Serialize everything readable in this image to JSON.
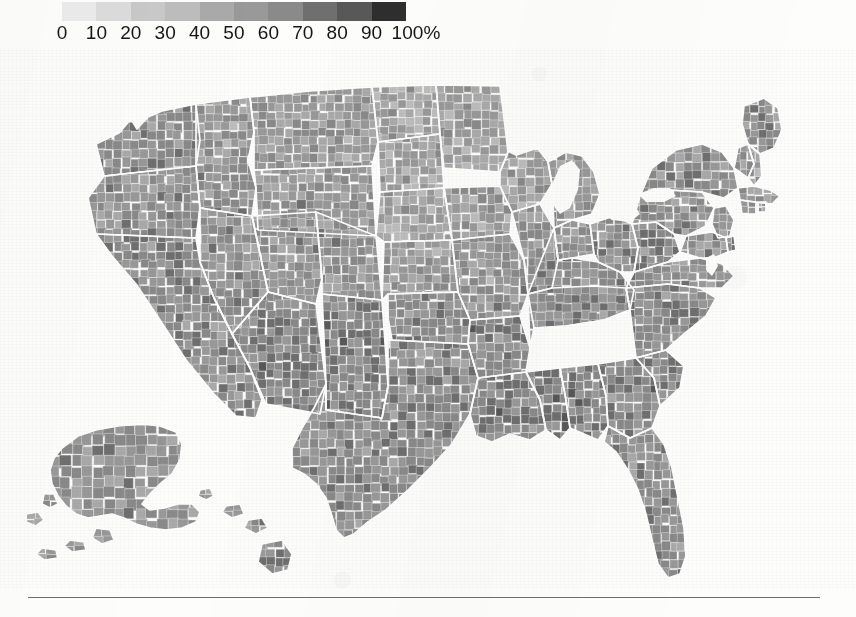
{
  "legend": {
    "name": "percent-scale-legend",
    "unit": "%",
    "ticks": [
      "0",
      "10",
      "20",
      "30",
      "40",
      "50",
      "60",
      "70",
      "80",
      "90",
      "100%"
    ],
    "swatch_colors": [
      "#ebebeb",
      "#dcdcdc",
      "#c9c9c9",
      "#bdbdbd",
      "#aaaaaa",
      "#999999",
      "#8a8a8a",
      "#6f6f6f",
      "#585858",
      "#2e2e2e"
    ],
    "bin_labels": [
      "0–10",
      "10–20",
      "20–30",
      "30–40",
      "40–50",
      "50–60",
      "60–70",
      "70–80",
      "80–90",
      "90–100"
    ]
  },
  "map": {
    "name": "us-county-choropleth",
    "background": "#fdfdfc",
    "border_color": "#ffffff",
    "water_color": "#fdfdfc",
    "insets": [
      "Alaska",
      "Hawaii"
    ],
    "features": [
      "Great Lakes",
      "Chesapeake Bay",
      "Long Island",
      "Cape Cod",
      "Florida Peninsula",
      "Gulf of Mexico",
      "Puget Sound"
    ]
  },
  "rule": {
    "name": "footer-rule",
    "color": "#6b6b6b"
  },
  "chart_data": {
    "type": "heatmap",
    "title": "",
    "subtitle": "",
    "xlabel": "",
    "ylabel": "",
    "legend_position": "top-left",
    "grid": false,
    "colorscale": {
      "name": "grayscale-sequential",
      "min": 0,
      "max": 100,
      "unit": "%",
      "step": 10,
      "ticks": [
        0,
        10,
        20,
        30,
        40,
        50,
        60,
        70,
        80,
        90,
        100
      ],
      "colors": [
        "#ebebeb",
        "#dcdcdc",
        "#c9c9c9",
        "#bdbdbd",
        "#aaaaaa",
        "#999999",
        "#8a8a8a",
        "#6f6f6f",
        "#585858",
        "#2e2e2e"
      ]
    },
    "geography": "United States counties",
    "regions": [
      {
        "name": "Pacific Northwest",
        "value": 60
      },
      {
        "name": "Northern Rockies",
        "value": 55
      },
      {
        "name": "Great Basin",
        "value": 58
      },
      {
        "name": "California",
        "value": 62
      },
      {
        "name": "Desert Southwest",
        "value": 66
      },
      {
        "name": "Southern Plains",
        "value": 62
      },
      {
        "name": "Northern Plains",
        "value": 48
      },
      {
        "name": "Upper Midwest",
        "value": 50
      },
      {
        "name": "Corn Belt",
        "value": 52
      },
      {
        "name": "Ohio Valley",
        "value": 58
      },
      {
        "name": "Appalachia",
        "value": 63
      },
      {
        "name": "Deep South",
        "value": 66
      },
      {
        "name": "Atlantic Southeast",
        "value": 62
      },
      {
        "name": "Florida",
        "value": 60
      },
      {
        "name": "Mid-Atlantic",
        "value": 58
      },
      {
        "name": "New England",
        "value": 60
      },
      {
        "name": "Alaska",
        "value": 58
      },
      {
        "name": "Hawaii",
        "value": 60
      }
    ]
  }
}
